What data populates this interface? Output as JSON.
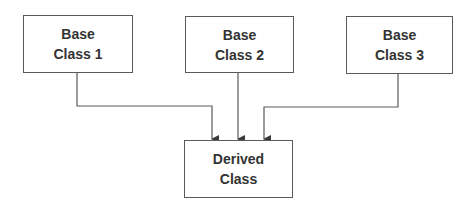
{
  "diagram": {
    "type": "class-inheritance",
    "colors": {
      "line": "#5a5a5a",
      "text": "#333333",
      "background": "#ffffff"
    },
    "nodes": [
      {
        "id": "base1",
        "line1": "Base",
        "line2": "Class 1"
      },
      {
        "id": "base2",
        "line1": "Base",
        "line2": "Class 2"
      },
      {
        "id": "base3",
        "line1": "Base",
        "line2": "Class 3"
      },
      {
        "id": "derived",
        "line1": "Derived",
        "line2": "Class"
      }
    ],
    "edges": [
      {
        "from": "base1",
        "to": "derived",
        "arrow": "end"
      },
      {
        "from": "base2",
        "to": "derived",
        "arrow": "end"
      },
      {
        "from": "base3",
        "to": "derived",
        "arrow": "end"
      }
    ]
  }
}
